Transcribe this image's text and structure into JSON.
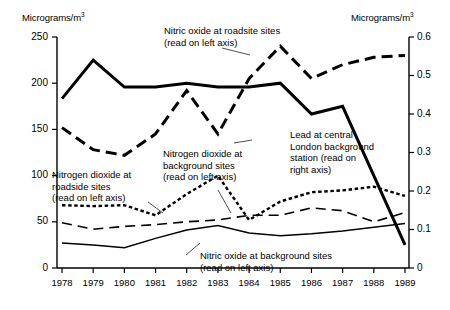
{
  "chart_data": {
    "type": "line",
    "title": "",
    "xlabel": "",
    "ylabel": "Micrograms/m3",
    "y2label": "Micrograms/m3",
    "grid": false,
    "legend_position": "inline-annotations",
    "x": [
      1978,
      1979,
      1980,
      1981,
      1982,
      1983,
      1984,
      1985,
      1986,
      1987,
      1988,
      1989
    ],
    "xtick_labels": [
      "1978",
      "1979",
      "1980",
      "1981",
      "1982",
      "1983",
      "1984",
      "1985",
      "1986",
      "1987",
      "1988",
      "1989"
    ],
    "ylim": [
      0,
      250
    ],
    "ytick_labels": [
      "0",
      "50",
      "100",
      "150",
      "200",
      "250"
    ],
    "ytick_values": [
      0,
      50,
      100,
      150,
      200,
      250
    ],
    "y2lim": [
      0,
      0.6
    ],
    "y2tick_labels": [
      "0",
      "0.1",
      "0.2",
      "0.3",
      "0.4",
      "0.5",
      "0.6"
    ],
    "y2tick_values": [
      0,
      0.1,
      0.2,
      0.3,
      0.4,
      0.5,
      0.6
    ],
    "series": [
      {
        "name": "Nitric oxide at roadsite sites",
        "axis": "left",
        "style": "thick-dashed",
        "values": [
          152,
          128,
          122,
          145,
          192,
          145,
          205,
          240,
          205,
          220,
          228,
          230
        ]
      },
      {
        "name": "Lead at central London background station",
        "axis": "right",
        "style": "thick-solid",
        "values": [
          0.44,
          0.54,
          0.47,
          0.47,
          0.48,
          0.47,
          0.47,
          0.48,
          0.4,
          0.42,
          0.24,
          0.06
        ]
      },
      {
        "name": "Nitrogen dioxide at roadside sites",
        "axis": "left",
        "style": "fine-dotted",
        "values": [
          68,
          67,
          68,
          57,
          80,
          100,
          52,
          72,
          82,
          84,
          88,
          78
        ]
      },
      {
        "name": "Nitrogen dioxide at background sites",
        "axis": "left",
        "style": "long-dashed",
        "values": [
          49,
          42,
          45,
          47,
          50,
          52,
          57,
          57,
          65,
          62,
          50,
          60
        ]
      },
      {
        "name": "Nitric oxide at background sites",
        "axis": "left",
        "style": "thin-solid",
        "values": [
          27,
          25,
          22,
          32,
          41,
          46,
          38,
          35,
          37,
          40,
          44,
          48
        ]
      }
    ],
    "annotations": [
      {
        "id": "no_roadside",
        "line1": "Nitric oxide at roadsite sites",
        "line2": "(read on left axis)"
      },
      {
        "id": "lead",
        "line1": "Lead at central",
        "line2": "London background",
        "line3": "station (read on",
        "line4": "right axis)"
      },
      {
        "id": "no2_background",
        "line1": "Nitrogen dioxide at",
        "line2": "background sites",
        "line3": "(read on left axis)"
      },
      {
        "id": "no2_roadside",
        "line1": "Nitrogen dioxide at",
        "line2": "roadside sites",
        "line3": "(read on left axis)"
      },
      {
        "id": "no_background",
        "line1": "Nitric oxide at background sites",
        "line2": "(read on left axis)"
      }
    ]
  },
  "axes": {
    "left_title_text": "Micrograms/m",
    "left_title_sup": "3",
    "right_title_text": "Micrograms/m",
    "right_title_sup": "3"
  }
}
